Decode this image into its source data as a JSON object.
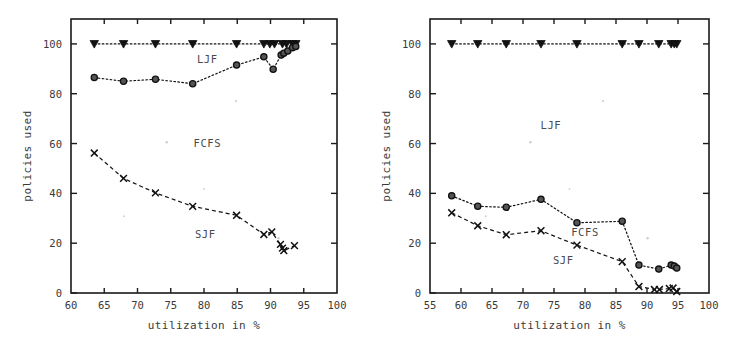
{
  "figure": {
    "panels": [
      {
        "id": "left",
        "xlabel": "utilization in %",
        "ylabel": "policies used",
        "xlim": [
          60,
          100
        ],
        "ylim": [
          0,
          110
        ],
        "xticks": [
          60,
          65,
          70,
          75,
          80,
          85,
          90,
          95,
          100
        ],
        "yticks": [
          0,
          20,
          40,
          60,
          80,
          100
        ],
        "region_labels": [
          {
            "text": "LJF",
            "x": 80.5,
            "y": 92.5
          },
          {
            "text": "FCFS",
            "x": 80.5,
            "y": 58.5
          },
          {
            "text": "SJF",
            "x": 80.2,
            "y": 22.0
          }
        ]
      },
      {
        "id": "right",
        "xlabel": "utilization in %",
        "ylabel": "policies used",
        "xlim": [
          55,
          100
        ],
        "ylim": [
          0,
          110
        ],
        "xticks": [
          55,
          60,
          65,
          70,
          75,
          80,
          85,
          90,
          95,
          100
        ],
        "yticks": [
          0,
          20,
          40,
          60,
          80,
          100
        ],
        "region_labels": [
          {
            "text": "LJF",
            "x": 74.5,
            "y": 66.0
          },
          {
            "text": "FCFS",
            "x": 80.0,
            "y": 23.0
          },
          {
            "text": "SJF",
            "x": 76.5,
            "y": 11.5
          }
        ]
      }
    ]
  },
  "chart_data": [
    {
      "type": "line",
      "panel": "left",
      "title": "",
      "xlabel": "utilization in %",
      "ylabel": "policies used",
      "xlim": [
        60,
        100
      ],
      "ylim": [
        0,
        110
      ],
      "xticks": [
        60,
        65,
        70,
        75,
        80,
        85,
        90,
        95,
        100
      ],
      "yticks": [
        0,
        20,
        40,
        60,
        80,
        100
      ],
      "grid": false,
      "legend": "in-plot region labels",
      "series": [
        {
          "name": "LJF",
          "marker": "filled-triangle-down",
          "linestyle": "dotted",
          "x": [
            63.5,
            67.9,
            72.7,
            78.3,
            84.9,
            89.0,
            89.9,
            90.6,
            91.8,
            92.4,
            93.3,
            93.8
          ],
          "y": [
            100,
            100,
            100,
            100,
            100,
            100,
            100,
            100,
            100,
            100,
            100,
            100
          ]
        },
        {
          "name": "FCFS",
          "marker": "open-circle",
          "linestyle": "dotted",
          "x": [
            63.5,
            67.9,
            72.7,
            78.3,
            84.9,
            89.0,
            90.4,
            91.6,
            92.0,
            92.6,
            93.3,
            93.8
          ],
          "y": [
            86.5,
            85.0,
            85.8,
            84.0,
            91.5,
            94.8,
            89.8,
            95.5,
            96.3,
            97.2,
            98.5,
            99.0
          ]
        },
        {
          "name": "SJF",
          "marker": "cross",
          "linestyle": "dashed",
          "x": [
            63.5,
            67.9,
            72.7,
            78.3,
            84.9,
            89.0,
            90.2,
            91.5,
            91.8,
            92.0,
            93.6
          ],
          "y": [
            56.2,
            46.0,
            40.2,
            34.8,
            31.2,
            23.5,
            24.5,
            19.5,
            18.0,
            17.0,
            19.0
          ]
        }
      ]
    },
    {
      "type": "line",
      "panel": "right",
      "title": "",
      "xlabel": "utilization in %",
      "ylabel": "policies used",
      "xlim": [
        55,
        100
      ],
      "ylim": [
        0,
        110
      ],
      "xticks": [
        55,
        60,
        65,
        70,
        75,
        80,
        85,
        90,
        95,
        100
      ],
      "yticks": [
        0,
        20,
        40,
        60,
        80,
        100
      ],
      "grid": false,
      "legend": "in-plot region labels",
      "series": [
        {
          "name": "LJF",
          "marker": "filled-triangle-down",
          "linestyle": "dotted",
          "x": [
            58.5,
            62.7,
            67.3,
            72.9,
            78.7,
            86.0,
            88.7,
            91.9,
            93.9,
            94.4,
            94.8
          ],
          "y": [
            100,
            100,
            100,
            100,
            100,
            100,
            100,
            100,
            100,
            100,
            100
          ]
        },
        {
          "name": "FCFS",
          "marker": "open-circle",
          "linestyle": "dotted",
          "x": [
            58.5,
            62.7,
            67.3,
            72.9,
            78.7,
            86.0,
            88.7,
            91.9,
            93.9,
            94.4,
            94.8
          ],
          "y": [
            39.0,
            34.8,
            34.4,
            37.6,
            28.2,
            28.8,
            11.2,
            9.6,
            11.2,
            10.8,
            10.0
          ]
        },
        {
          "name": "SJF",
          "marker": "cross",
          "linestyle": "dashed",
          "x": [
            58.5,
            62.7,
            67.3,
            72.9,
            78.7,
            86.0,
            88.7,
            91.2,
            92.0,
            93.6,
            94.2,
            94.8
          ],
          "y": [
            32.2,
            27.0,
            23.4,
            25.0,
            19.2,
            12.6,
            2.6,
            1.4,
            1.4,
            1.8,
            2.0,
            0.6
          ]
        }
      ]
    }
  ]
}
